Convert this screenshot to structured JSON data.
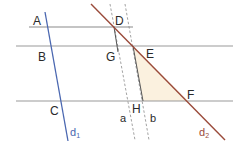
{
  "diagram": {
    "colors": {
      "horizontal_lines": "#8a8a8a",
      "d1": "#4a67b0",
      "d2": "#9a4a3a",
      "dashed": "#8a8a8a",
      "segment": "#555555",
      "triangle_fill": "#fbf1df",
      "label": "#2a2a2a"
    },
    "points": {
      "A": "A",
      "B": "B",
      "C": "C",
      "D": "D",
      "E": "E",
      "F": "F",
      "G": "G",
      "H": "H"
    },
    "lines": {
      "a": "a",
      "b": "b",
      "d1_main": "d",
      "d1_sub": "1",
      "d2_main": "d",
      "d2_sub": "2"
    }
  }
}
